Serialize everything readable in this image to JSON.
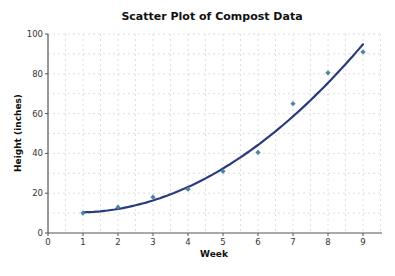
{
  "chart_data": {
    "type": "scatter",
    "title": "Scatter Plot of Compost Data",
    "xlabel": "Week",
    "ylabel": "Height (inches)",
    "xlim": [
      0,
      9.5
    ],
    "ylim": [
      0,
      100
    ],
    "x_ticks": [
      0,
      1,
      2,
      3,
      4,
      5,
      6,
      7,
      8,
      9
    ],
    "y_ticks": [
      0,
      20,
      40,
      60,
      80,
      100
    ],
    "grid": true,
    "legend": null,
    "series": [
      {
        "name": "Compost Data",
        "kind": "scatter",
        "x": [
          1,
          2,
          3,
          4,
          5,
          6,
          7,
          8,
          9
        ],
        "y": [
          10,
          13,
          18,
          22,
          31,
          40.5,
          65,
          80.5,
          91
        ],
        "color": "#4a86a8"
      },
      {
        "name": "Trend (quadratic fit)",
        "kind": "line",
        "x": [
          1,
          2,
          3,
          4,
          5,
          6,
          7,
          8,
          9
        ],
        "y": [
          10,
          12,
          17,
          23.5,
          32.5,
          44,
          58,
          75,
          95.5
        ],
        "color": "#2c3b7c"
      }
    ]
  }
}
